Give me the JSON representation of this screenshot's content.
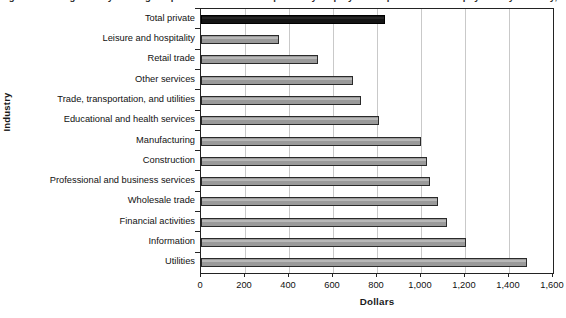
{
  "figure": {
    "title": "Figure 1. Average hourly earnings of production and nonsupervisory employees on private nonfarm payrolls by industry, January 2012"
  },
  "chart_data": {
    "type": "bar",
    "orientation": "horizontal",
    "title": "Figure 1. Average hourly earnings of production and nonsupervisory employees on private nonfarm payrolls by industry, January 2012",
    "xlabel": "Dollars",
    "ylabel": "Industry",
    "xlim": [
      0,
      1600
    ],
    "xticks": [
      0,
      200,
      400,
      600,
      800,
      1000,
      1200,
      1400,
      1600
    ],
    "xtick_labels": [
      "0",
      "200",
      "400",
      "600",
      "800",
      "1,000",
      "1,200",
      "1,400",
      "1,600"
    ],
    "grid": "vertical",
    "legend": "none",
    "bar_color": "#9a9a9a",
    "highlight_color": "#141414",
    "highlight_category": "Total private",
    "categories": [
      "Total private",
      "Leisure and hospitality",
      "Retail trade",
      "Other services",
      "Trade, transportation, and utilities",
      "Educational and health services",
      "Manufacturing",
      "Construction",
      "Professional and business services",
      "Wholesale trade",
      "Financial activities",
      "Information",
      "Utilities"
    ],
    "values": [
      836,
      355,
      530,
      690,
      727,
      808,
      1000,
      1025,
      1040,
      1078,
      1118,
      1205,
      1300
    ],
    "bars": [
      {
        "category": "Total private",
        "value": 836,
        "highlight": true
      },
      {
        "category": "Leisure and hospitality",
        "value": 355,
        "highlight": false
      },
      {
        "category": "Retail trade",
        "value": 530,
        "highlight": false
      },
      {
        "category": "Other services",
        "value": 690,
        "highlight": false
      },
      {
        "category": "Trade, transportation, and utilities",
        "value": 727,
        "highlight": false
      },
      {
        "category": "Educational and health services",
        "value": 808,
        "highlight": false
      },
      {
        "category": "Manufacturing",
        "value": 1000,
        "highlight": false
      },
      {
        "category": "Construction",
        "value": 1025,
        "highlight": false
      },
      {
        "category": "Professional and business services",
        "value": 1040,
        "highlight": false
      },
      {
        "category": "Wholesale trade",
        "value": 1078,
        "highlight": false
      },
      {
        "category": "Financial activities",
        "value": 1118,
        "highlight": false
      },
      {
        "category": "Information",
        "value": 1205,
        "highlight": false
      },
      {
        "category": "Utilities",
        "value": 1480,
        "highlight": false
      }
    ]
  }
}
